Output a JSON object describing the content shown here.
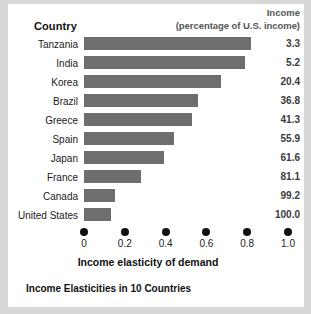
{
  "header": {
    "country_label": "Country",
    "income_line1": "Income",
    "income_line2": "(percentage of U.S. income)"
  },
  "caption": "Income Elasticities in 10 Countries",
  "colors": {
    "bar_fill": "#6e6e6e",
    "page_background": "#ffffff",
    "outer_background": "#d8d8d8",
    "text": "#111111"
  },
  "chart_data": {
    "type": "bar",
    "orientation": "horizontal",
    "title": "Income Elasticities in 10 Countries",
    "xlabel": "Income elasticity of demand",
    "ylabel": "Country",
    "xlim": [
      0,
      1.0
    ],
    "grid": false,
    "legend": "none",
    "xticks": [
      "0",
      "0.2",
      "0.4",
      "0.6",
      "0.8",
      "1.0"
    ],
    "xtick_values": [
      0,
      0.2,
      0.4,
      0.6,
      0.8,
      1.0
    ],
    "categories": [
      "Tanzania",
      "India",
      "Korea",
      "Brazil",
      "Greece",
      "Spain",
      "Japan",
      "France",
      "Canada",
      "United States"
    ],
    "values": [
      0.82,
      0.79,
      0.67,
      0.56,
      0.53,
      0.44,
      0.39,
      0.28,
      0.15,
      0.13
    ],
    "series": [
      {
        "name": "Income elasticity of demand",
        "values": [
          0.82,
          0.79,
          0.67,
          0.56,
          0.53,
          0.44,
          0.39,
          0.28,
          0.15,
          0.13
        ]
      },
      {
        "name": "Income (percentage of U.S. income)",
        "values": [
          3.3,
          5.2,
          20.4,
          36.8,
          41.3,
          55.9,
          61.6,
          81.1,
          99.2,
          100.0
        ]
      }
    ],
    "income_labels": [
      "3.3",
      "5.2",
      "20.4",
      "36.8",
      "41.3",
      "55.9",
      "61.6",
      "81.1",
      "99.2",
      "100.0"
    ]
  }
}
